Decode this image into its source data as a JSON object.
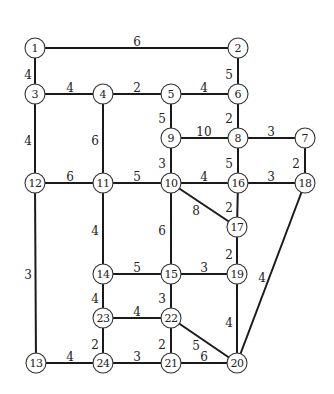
{
  "diagram": {
    "type": "weighted-undirected-graph",
    "node_radius": 10,
    "nodes": [
      {
        "id": "1",
        "x": 35,
        "y": 48
      },
      {
        "id": "2",
        "x": 238,
        "y": 48
      },
      {
        "id": "3",
        "x": 35,
        "y": 94
      },
      {
        "id": "4",
        "x": 103,
        "y": 94
      },
      {
        "id": "5",
        "x": 171,
        "y": 94
      },
      {
        "id": "6",
        "x": 238,
        "y": 94
      },
      {
        "id": "7",
        "x": 305,
        "y": 138
      },
      {
        "id": "8",
        "x": 238,
        "y": 138
      },
      {
        "id": "9",
        "x": 171,
        "y": 138
      },
      {
        "id": "10",
        "x": 171,
        "y": 183
      },
      {
        "id": "11",
        "x": 103,
        "y": 183
      },
      {
        "id": "12",
        "x": 35,
        "y": 183
      },
      {
        "id": "13",
        "x": 36,
        "y": 363
      },
      {
        "id": "14",
        "x": 103,
        "y": 274
      },
      {
        "id": "15",
        "x": 171,
        "y": 274
      },
      {
        "id": "16",
        "x": 238,
        "y": 183
      },
      {
        "id": "17",
        "x": 237,
        "y": 227
      },
      {
        "id": "18",
        "x": 305,
        "y": 183
      },
      {
        "id": "19",
        "x": 237,
        "y": 274
      },
      {
        "id": "20",
        "x": 237,
        "y": 363
      },
      {
        "id": "21",
        "x": 171,
        "y": 363
      },
      {
        "id": "22",
        "x": 171,
        "y": 318
      },
      {
        "id": "23",
        "x": 103,
        "y": 318
      },
      {
        "id": "24",
        "x": 103,
        "y": 363
      }
    ],
    "edges": [
      {
        "from": "1",
        "to": "2",
        "weight": "6",
        "lx": 137,
        "ly": 42
      },
      {
        "from": "1",
        "to": "3",
        "weight": "4",
        "lx": 28,
        "ly": 75
      },
      {
        "from": "2",
        "to": "6",
        "weight": "5",
        "lx": 229,
        "ly": 75
      },
      {
        "from": "3",
        "to": "4",
        "weight": "4",
        "lx": 70,
        "ly": 88
      },
      {
        "from": "4",
        "to": "5",
        "weight": "2",
        "lx": 137,
        "ly": 88
      },
      {
        "from": "5",
        "to": "6",
        "weight": "4",
        "lx": 204,
        "ly": 88
      },
      {
        "from": "3",
        "to": "12",
        "weight": "4",
        "lx": 28,
        "ly": 141
      },
      {
        "from": "4",
        "to": "11",
        "weight": "6",
        "lx": 95,
        "ly": 141
      },
      {
        "from": "5",
        "to": "9",
        "weight": "5",
        "lx": 162,
        "ly": 119
      },
      {
        "from": "6",
        "to": "8",
        "weight": "2",
        "lx": 229,
        "ly": 119
      },
      {
        "from": "9",
        "to": "8",
        "weight": "10",
        "lx": 204,
        "ly": 132
      },
      {
        "from": "8",
        "to": "7",
        "weight": "3",
        "lx": 271,
        "ly": 132
      },
      {
        "from": "9",
        "to": "10",
        "weight": "3",
        "lx": 162,
        "ly": 164
      },
      {
        "from": "8",
        "to": "16",
        "weight": "5",
        "lx": 229,
        "ly": 164
      },
      {
        "from": "7",
        "to": "18",
        "weight": "2",
        "lx": 296,
        "ly": 164
      },
      {
        "from": "12",
        "to": "11",
        "weight": "6",
        "lx": 70,
        "ly": 177
      },
      {
        "from": "11",
        "to": "10",
        "weight": "5",
        "lx": 137,
        "ly": 177
      },
      {
        "from": "10",
        "to": "16",
        "weight": "4",
        "lx": 204,
        "ly": 177
      },
      {
        "from": "16",
        "to": "18",
        "weight": "3",
        "lx": 271,
        "ly": 177
      },
      {
        "from": "10",
        "to": "17",
        "weight": "8",
        "lx": 196,
        "ly": 211
      },
      {
        "from": "16",
        "to": "17",
        "weight": "2",
        "lx": 229,
        "ly": 208
      },
      {
        "from": "12",
        "to": "13",
        "weight": "3",
        "lx": 28,
        "ly": 275
      },
      {
        "from": "11",
        "to": "14",
        "weight": "4",
        "lx": 95,
        "ly": 231
      },
      {
        "from": "10",
        "to": "15",
        "weight": "6",
        "lx": 162,
        "ly": 231
      },
      {
        "from": "17",
        "to": "19",
        "weight": "2",
        "lx": 229,
        "ly": 255
      },
      {
        "from": "18",
        "to": "20",
        "weight": "4",
        "lx": 262,
        "ly": 278
      },
      {
        "from": "14",
        "to": "15",
        "weight": "5",
        "lx": 137,
        "ly": 268
      },
      {
        "from": "15",
        "to": "19",
        "weight": "3",
        "lx": 204,
        "ly": 268
      },
      {
        "from": "14",
        "to": "23",
        "weight": "4",
        "lx": 95,
        "ly": 299
      },
      {
        "from": "15",
        "to": "22",
        "weight": "3",
        "lx": 162,
        "ly": 299
      },
      {
        "from": "19",
        "to": "20",
        "weight": "4",
        "lx": 229,
        "ly": 323
      },
      {
        "from": "23",
        "to": "22",
        "weight": "4",
        "lx": 137,
        "ly": 312
      },
      {
        "from": "23",
        "to": "24",
        "weight": "2",
        "lx": 95,
        "ly": 345
      },
      {
        "from": "22",
        "to": "21",
        "weight": "2",
        "lx": 162,
        "ly": 345
      },
      {
        "from": "22",
        "to": "20",
        "weight": "5",
        "lx": 196,
        "ly": 346
      },
      {
        "from": "13",
        "to": "24",
        "weight": "4",
        "lx": 70,
        "ly": 357
      },
      {
        "from": "24",
        "to": "21",
        "weight": "3",
        "lx": 137,
        "ly": 357
      },
      {
        "from": "21",
        "to": "20",
        "weight": "6",
        "lx": 204,
        "ly": 357
      }
    ]
  }
}
